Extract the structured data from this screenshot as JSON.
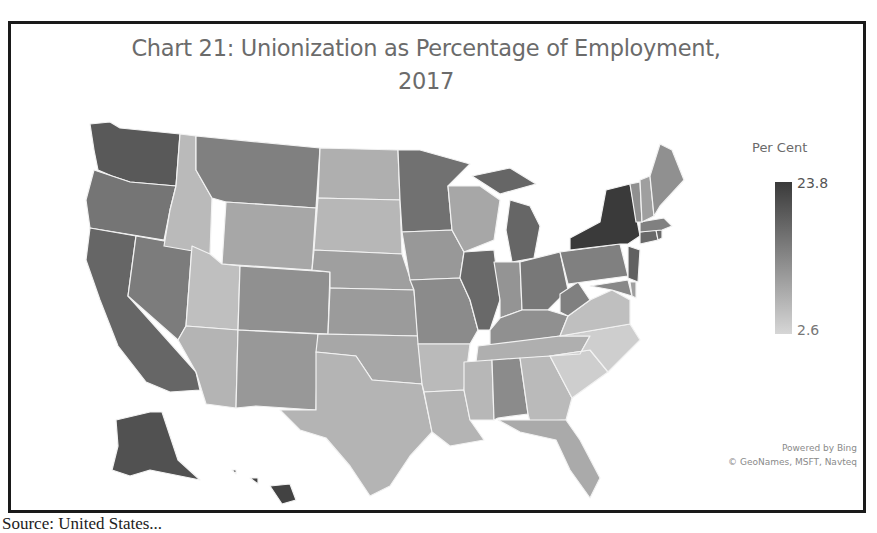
{
  "chart": {
    "title_line1": "Chart 21: Unionization as Percentage of Employment,",
    "title_line2": "2017",
    "legend": {
      "title": "Per Cent",
      "max_label": "23.8",
      "min_label": "2.6",
      "max_color": "#3a3a3a",
      "min_color": "#d6d6d6"
    },
    "attribution_line1": "Powered by Bing",
    "attribution_line2": "© GeoNames, MSFT, Navteq",
    "source_caption": "Source: United States..."
  },
  "chart_data": {
    "type": "choropleth",
    "title": "Chart 21: Unionization as Percentage of Employment, 2017",
    "legend_title": "Per Cent",
    "scale": {
      "min": 2.6,
      "max": 23.8,
      "min_color": "#d6d6d6",
      "max_color": "#3a3a3a"
    },
    "note": "Values estimated from grayscale shading; only min (2.6) and max (23.8) are labeled.",
    "regions": [
      {
        "state": "WA",
        "shade": 0.8
      },
      {
        "state": "OR",
        "shade": 0.62
      },
      {
        "state": "CA",
        "shade": 0.72
      },
      {
        "state": "NV",
        "shade": 0.58
      },
      {
        "state": "ID",
        "shade": 0.18
      },
      {
        "state": "MT",
        "shade": 0.55
      },
      {
        "state": "WY",
        "shade": 0.3
      },
      {
        "state": "UT",
        "shade": 0.15
      },
      {
        "state": "AZ",
        "shade": 0.22
      },
      {
        "state": "CO",
        "shade": 0.45
      },
      {
        "state": "NM",
        "shade": 0.4
      },
      {
        "state": "ND",
        "shade": 0.25
      },
      {
        "state": "SD",
        "shade": 0.2
      },
      {
        "state": "NE",
        "shade": 0.35
      },
      {
        "state": "KS",
        "shade": 0.38
      },
      {
        "state": "OK",
        "shade": 0.3
      },
      {
        "state": "TX",
        "shade": 0.22
      },
      {
        "state": "MN",
        "shade": 0.65
      },
      {
        "state": "IA",
        "shade": 0.4
      },
      {
        "state": "MO",
        "shade": 0.48
      },
      {
        "state": "AR",
        "shade": 0.18
      },
      {
        "state": "LA",
        "shade": 0.22
      },
      {
        "state": "WI",
        "shade": 0.3
      },
      {
        "state": "IL",
        "shade": 0.7
      },
      {
        "state": "MI",
        "shade": 0.72
      },
      {
        "state": "IN",
        "shade": 0.42
      },
      {
        "state": "OH",
        "shade": 0.6
      },
      {
        "state": "KY",
        "shade": 0.45
      },
      {
        "state": "TN",
        "shade": 0.25
      },
      {
        "state": "MS",
        "shade": 0.2
      },
      {
        "state": "AL",
        "shade": 0.48
      },
      {
        "state": "GA",
        "shade": 0.18
      },
      {
        "state": "FL",
        "shade": 0.28
      },
      {
        "state": "SC",
        "shade": 0.05
      },
      {
        "state": "NC",
        "shade": 0.05
      },
      {
        "state": "VA",
        "shade": 0.15
      },
      {
        "state": "WV",
        "shade": 0.55
      },
      {
        "state": "PA",
        "shade": 0.55
      },
      {
        "state": "NY",
        "shade": 1.0
      },
      {
        "state": "NJ",
        "shade": 0.75
      },
      {
        "state": "MD",
        "shade": 0.5
      },
      {
        "state": "DE",
        "shade": 0.35
      },
      {
        "state": "CT",
        "shade": 0.7
      },
      {
        "state": "RI",
        "shade": 0.7
      },
      {
        "state": "MA",
        "shade": 0.55
      },
      {
        "state": "VT",
        "shade": 0.45
      },
      {
        "state": "NH",
        "shade": 0.35
      },
      {
        "state": "ME",
        "shade": 0.45
      },
      {
        "state": "AK",
        "shade": 0.85
      },
      {
        "state": "HI",
        "shade": 0.95
      }
    ]
  }
}
